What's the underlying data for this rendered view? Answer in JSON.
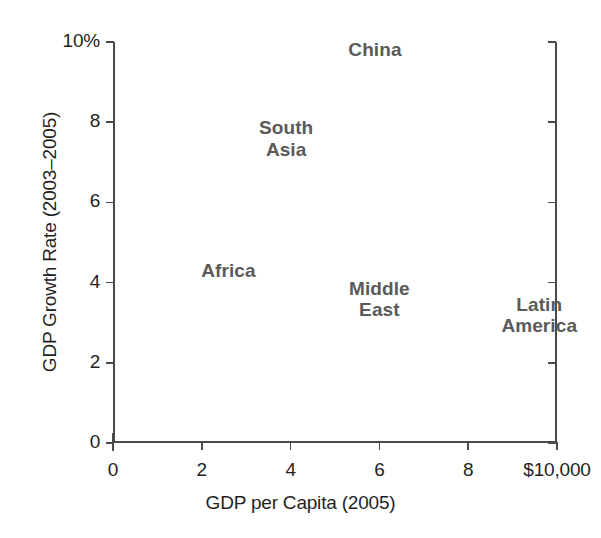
{
  "chart_data": {
    "type": "scatter",
    "title": "",
    "xlabel": "GDP per Capita (2005)",
    "ylabel": "GDP Growth Rate (2003–2005)",
    "xlim": [
      0,
      10
    ],
    "ylim": [
      0,
      10
    ],
    "grid": false,
    "legend": "none",
    "note": "Data points are rendered as bold text labels only; no markers are drawn. X values are in thousands of US dollars of GDP per capita; Y values are percent annual GDP growth.",
    "x_ticks": [
      {
        "value": 0,
        "label": "0"
      },
      {
        "value": 2,
        "label": "2"
      },
      {
        "value": 4,
        "label": "4"
      },
      {
        "value": 6,
        "label": "6"
      },
      {
        "value": 8,
        "label": "8"
      },
      {
        "value": 10,
        "label": "$10,000"
      }
    ],
    "y_ticks": [
      {
        "value": 0,
        "label": "0"
      },
      {
        "value": 2,
        "label": "2"
      },
      {
        "value": 4,
        "label": "4"
      },
      {
        "value": 6,
        "label": "6"
      },
      {
        "value": 8,
        "label": "8"
      },
      {
        "value": 10,
        "label": "10%"
      }
    ],
    "points": [
      {
        "name": "China",
        "label": "China",
        "x": 5.9,
        "y": 9.8
      },
      {
        "name": "South Asia",
        "label": "South\nAsia",
        "x": 3.9,
        "y": 7.6
      },
      {
        "name": "Africa",
        "label": "Africa",
        "x": 2.6,
        "y": 4.3
      },
      {
        "name": "Middle East",
        "label": "Middle\nEast",
        "x": 6.0,
        "y": 3.6
      },
      {
        "name": "Latin America",
        "label": "Latin\nAmerica",
        "x": 9.6,
        "y": 3.2
      }
    ],
    "colors": {
      "axis": "#4a4a4a",
      "tick_label": "#1f1f1f",
      "axis_title": "#1f1f1f",
      "data_label": "#5a5a5a",
      "background": "#ffffff"
    }
  }
}
